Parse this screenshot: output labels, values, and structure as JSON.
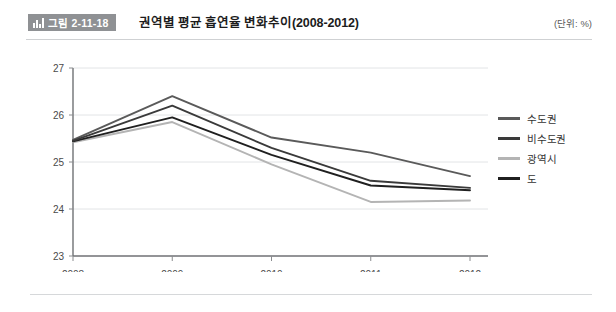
{
  "header": {
    "badge_icon": "bar-chart-icon",
    "badge_label": "그림 2-11-18",
    "title": "권역별 평균 흡연율 변화추이(2008-2012)",
    "unit": "(단위: %)"
  },
  "chart_data": {
    "type": "line",
    "title": "권역별 평균 흡연율 변화추이(2008-2012)",
    "xlabel": "",
    "ylabel": "",
    "unit": "%",
    "categories": [
      "2008",
      "2009",
      "2010",
      "2011",
      "2012"
    ],
    "x": [
      2008,
      2009,
      2010,
      2011,
      2012
    ],
    "ylim": [
      23,
      27
    ],
    "yticks": [
      "23",
      "24",
      "25",
      "26",
      "27"
    ],
    "ytick_values": [
      23,
      24,
      25,
      26,
      27
    ],
    "grid": true,
    "legend_position": "right",
    "series": [
      {
        "name": "수도권",
        "color": "#5a5a5a",
        "values": [
          25.47,
          26.4,
          25.52,
          25.2,
          24.7
        ]
      },
      {
        "name": "비수도권",
        "color": "#3a3a3a",
        "values": [
          25.45,
          26.2,
          25.3,
          24.6,
          24.45
        ]
      },
      {
        "name": "광역시",
        "color": "#b4b4b4",
        "values": [
          25.42,
          25.85,
          24.95,
          24.15,
          24.18
        ]
      },
      {
        "name": "도",
        "color": "#1f1f1f",
        "values": [
          25.44,
          25.95,
          25.15,
          24.5,
          24.4
        ]
      }
    ]
  },
  "axis": {
    "y_ticks": [
      "27",
      "26",
      "25",
      "24",
      "23"
    ],
    "x_ticks": [
      "2008",
      "2009",
      "2010",
      "2011",
      "2012"
    ]
  }
}
